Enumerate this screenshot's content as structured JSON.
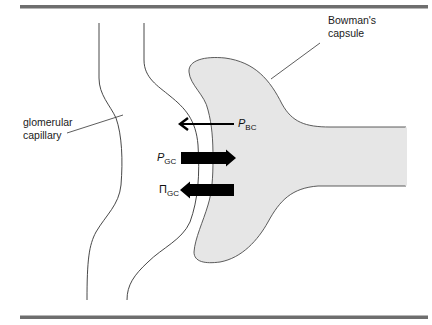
{
  "figure": {
    "type": "anatomical-diagram"
  },
  "labels": {
    "bowmans_capsule_line1": "Bowman's",
    "bowmans_capsule_line2": "capsule",
    "glomerular_capillary_line1": "glomerular",
    "glomerular_capillary_line2": "capillary"
  },
  "forces": [
    {
      "symbol": "P",
      "subscript": "BC",
      "direction": "left",
      "arrow_style": "thin"
    },
    {
      "symbol": "P",
      "subscript": "GC",
      "direction": "right",
      "arrow_style": "thick"
    },
    {
      "symbol": "Π",
      "subscript": "GC",
      "direction": "left",
      "arrow_style": "thick"
    }
  ],
  "colors": {
    "rule_bar": "#6e6e6e",
    "capsule_fill": "#e6e6e6",
    "outline": "#4a4a4a",
    "arrow": "#000000"
  }
}
